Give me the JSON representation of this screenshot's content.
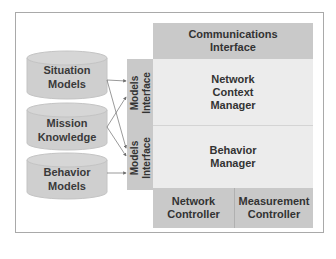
{
  "diagram": {
    "type": "architecture-block-diagram",
    "colors": {
      "dark_block": "#c9c9c9",
      "light_block": "#ececec",
      "cylinder": "#cfcfcf",
      "frame": "#a9a9a9",
      "text": "#333333",
      "arrow": "#6e6e6e"
    },
    "knowledge_stores": [
      {
        "id": "situation-models",
        "line1": "Situation",
        "line2": "Models"
      },
      {
        "id": "mission-knowledge",
        "line1": "Mission",
        "line2": "Knowledge"
      },
      {
        "id": "behavior-models",
        "line1": "Behavior",
        "line2": "Models"
      }
    ],
    "models_interfaces": [
      {
        "id": "models-interface-top",
        "label": "Models\nInterface"
      },
      {
        "id": "models-interface-bottom",
        "label": "Models\nInterface"
      }
    ],
    "blocks": {
      "communications_interface": {
        "line1": "Communications",
        "line2": "Interface"
      },
      "network_context_manager": {
        "line1": "Network",
        "line2": "Context",
        "line3": "Manager"
      },
      "behavior_manager": {
        "line1": "Behavior",
        "line2": "Manager"
      },
      "network_controller": {
        "line1": "Network",
        "line2": "Controller"
      },
      "measurement_controller": {
        "line1": "Measurement",
        "line2": "Controller"
      }
    },
    "connections": [
      {
        "from": "Situation Models",
        "to": "Models Interface (top)"
      },
      {
        "from": "Situation Models",
        "to": "Models Interface (bottom)"
      },
      {
        "from": "Mission Knowledge",
        "to": "Models Interface (top)"
      },
      {
        "from": "Mission Knowledge",
        "to": "Models Interface (bottom)"
      },
      {
        "from": "Behavior Models",
        "to": "Models Interface (bottom)"
      }
    ]
  }
}
